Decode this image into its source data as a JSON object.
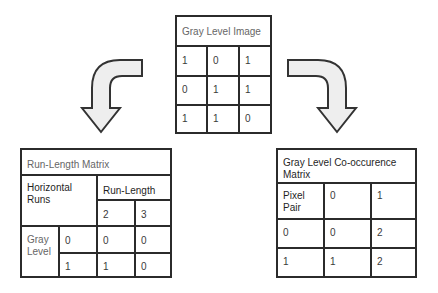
{
  "gray_level_image": {
    "title": "Gray Level Image",
    "rows": [
      [
        "1",
        "0",
        "1"
      ],
      [
        "0",
        "1",
        "1"
      ],
      [
        "1",
        "1",
        "0"
      ]
    ]
  },
  "run_length_matrix": {
    "title": "Run-Length Matrix",
    "corner_label": "Horizontal Runs",
    "column_group_label": "Run-Length",
    "columns": [
      "2",
      "3"
    ],
    "row_group_label": "Gray Level",
    "rows": [
      {
        "label": "0",
        "values": [
          "0",
          "0"
        ]
      },
      {
        "label": "1",
        "values": [
          "1",
          "0"
        ]
      }
    ]
  },
  "glcm": {
    "title": "Gray Level Co-occurence Matrix",
    "corner_label": "Pixel Pair",
    "columns": [
      "0",
      "1"
    ],
    "rows": [
      {
        "label": "0",
        "values": [
          "0",
          "2"
        ]
      },
      {
        "label": "1",
        "values": [
          "1",
          "2"
        ]
      }
    ]
  },
  "arrows": [
    {
      "name": "left-curved-arrow",
      "direction": "down-left"
    },
    {
      "name": "right-curved-arrow",
      "direction": "down-right"
    }
  ],
  "colors": {
    "border": "#2b2b2b",
    "arrow_fill": "#eeeeee",
    "text": "#333333"
  }
}
